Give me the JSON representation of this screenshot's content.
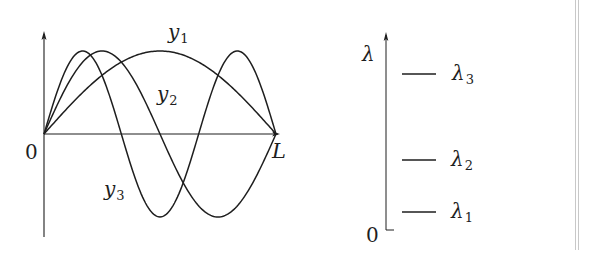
{
  "colors": {
    "ink": "#1e1e1e",
    "background": "#ffffff",
    "border": "#c8c8c8"
  },
  "left_panel": {
    "origin_label": "0",
    "end_label": "L",
    "curves": [
      {
        "name": "y",
        "sub": "1",
        "mode": 1
      },
      {
        "name": "y",
        "sub": "2",
        "mode": 2
      },
      {
        "name": "y",
        "sub": "3",
        "mode": 3
      }
    ]
  },
  "right_panel": {
    "axis_label": "λ",
    "origin_label": "0",
    "levels": [
      {
        "name": "λ",
        "sub": "3"
      },
      {
        "name": "λ",
        "sub": "2"
      },
      {
        "name": "λ",
        "sub": "1"
      }
    ]
  },
  "chart_data": [
    {
      "type": "line",
      "title": "Mode shapes y_n(x) = sin(nπx/L)",
      "xlabel": "x",
      "ylabel": "y",
      "x_range": [
        0,
        1
      ],
      "x_ticks": [
        "0",
        "L"
      ],
      "ylim": [
        -1,
        1
      ],
      "grid": false,
      "series": [
        {
          "name": "y1",
          "n": 1,
          "function": "sin(1*pi*x/L)",
          "peaks": [
            {
              "x": 0.5,
              "y": 1
            }
          ],
          "zeros": [
            0,
            1
          ]
        },
        {
          "name": "y2",
          "n": 2,
          "function": "sin(2*pi*x/L)",
          "peaks": [
            {
              "x": 0.25,
              "y": 1
            },
            {
              "x": 0.75,
              "y": -1
            }
          ],
          "zeros": [
            0,
            0.5,
            1
          ]
        },
        {
          "name": "y3",
          "n": 3,
          "function": "sin(3*pi*x/L)",
          "peaks": [
            {
              "x": 0.1667,
              "y": 1
            },
            {
              "x": 0.5,
              "y": -1
            },
            {
              "x": 0.8333,
              "y": 1
            }
          ],
          "zeros": [
            0,
            0.3333,
            0.6667,
            1
          ]
        }
      ]
    },
    {
      "type": "levels",
      "title": "Eigenvalue spectrum",
      "ylabel": "λ",
      "y_origin_label": "0",
      "levels": [
        {
          "name": "λ1",
          "relative_height": 0.1
        },
        {
          "name": "λ2",
          "relative_height": 0.36
        },
        {
          "name": "λ3",
          "relative_height": 0.79
        }
      ]
    }
  ]
}
